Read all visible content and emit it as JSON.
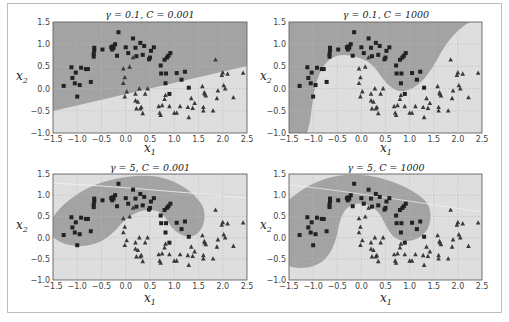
{
  "figure": {
    "colors": {
      "class0_region": "#a3a3a3",
      "class1_region": "#dedede",
      "square_marker": "#222222",
      "triangle_marker": "#3a3a3a",
      "grid": "#b9b9b9",
      "frame": "#bdbdbd",
      "axes_border": "#555555"
    }
  },
  "chart_data": [
    {
      "type": "scatter",
      "panel": "top-left",
      "title": "γ = 0.1, C = 0.001",
      "gamma": 0.1,
      "C": 0.001,
      "xlabel": "x1",
      "ylabel": "x2",
      "xlim": [
        -1.5,
        2.5
      ],
      "ylim": [
        -1.0,
        1.5
      ],
      "xticks": [
        -1.5,
        -1.0,
        -0.5,
        0.0,
        0.5,
        1.0,
        1.5,
        2.0,
        2.5
      ],
      "yticks": [
        -1.0,
        -0.5,
        0.0,
        0.5,
        1.0,
        1.5
      ],
      "xtick_labels": [
        "−1.5",
        "−1.0",
        "−0.5",
        "0.0",
        "0.5",
        "1.0",
        "1.5",
        "2.0",
        "2.5"
      ],
      "ytick_labels": [
        "−1.0",
        "−0.5",
        "0.0",
        "0.5",
        "1.0",
        "1.5"
      ],
      "grid": true,
      "decision_boundary": "nearly linear, rising from (-1.5,-0.6) to (2.5,1.0)"
    },
    {
      "type": "scatter",
      "panel": "top-right",
      "title": "γ = 0.1, C = 1000",
      "gamma": 0.1,
      "C": 1000,
      "xlabel": "x1",
      "ylabel": "x2",
      "xlim": [
        -1.5,
        2.5
      ],
      "ylim": [
        -1.0,
        1.5
      ],
      "xticks": [
        -1.5,
        -1.0,
        -0.5,
        0.0,
        0.5,
        1.0,
        1.5,
        2.0,
        2.5
      ],
      "yticks": [
        -1.0,
        -0.5,
        0.0,
        0.5,
        1.0,
        1.5
      ],
      "xtick_labels": [
        "−1.5",
        "−1.0",
        "−0.5",
        "0.0",
        "0.5",
        "1.0",
        "1.5",
        "2.0",
        "2.5"
      ],
      "ytick_labels": [
        "−1.0",
        "−0.5",
        "0.0",
        "0.5",
        "1.0",
        "1.5"
      ],
      "grid": true,
      "decision_boundary": "smooth S-shaped curve following the moons"
    },
    {
      "type": "scatter",
      "panel": "bottom-left",
      "title": "γ = 5, C = 0.001",
      "gamma": 5,
      "C": 0.001,
      "xlabel": "x1",
      "ylabel": "x2",
      "xlim": [
        -1.5,
        2.5
      ],
      "ylim": [
        -1.0,
        1.5
      ],
      "xticks": [
        -1.5,
        -1.0,
        -0.5,
        0.0,
        0.5,
        1.0,
        1.5,
        2.0,
        2.5
      ],
      "yticks": [
        -1.0,
        -0.5,
        0.0,
        0.5,
        1.0,
        1.5
      ],
      "xtick_labels": [
        "−1.5",
        "−1.0",
        "−0.5",
        "0.0",
        "0.5",
        "1.0",
        "1.5",
        "2.0",
        "2.5"
      ],
      "ytick_labels": [
        "−1.0",
        "−0.5",
        "0.0",
        "0.5",
        "1.0",
        "1.5"
      ],
      "grid": true,
      "decision_boundary": "band-shaped region enclosing the upper moon"
    },
    {
      "type": "scatter",
      "panel": "bottom-right",
      "title": "γ = 5, C = 1000",
      "gamma": 5,
      "C": 1000,
      "xlabel": "x1",
      "ylabel": "x2",
      "xlim": [
        -1.5,
        2.5
      ],
      "ylim": [
        -1.0,
        1.5
      ],
      "xticks": [
        -1.5,
        -1.0,
        -0.5,
        0.0,
        0.5,
        1.0,
        1.5,
        2.0,
        2.5
      ],
      "yticks": [
        -1.0,
        -0.5,
        0.0,
        0.5,
        1.0,
        1.5
      ],
      "xtick_labels": [
        "−1.5",
        "−1.0",
        "−0.5",
        "0.0",
        "0.5",
        "1.0",
        "1.5",
        "2.0",
        "2.5"
      ],
      "ytick_labels": [
        "−1.0",
        "−0.5",
        "0.0",
        "0.5",
        "1.0",
        "1.5"
      ],
      "grid": true,
      "decision_boundary": "irregular, tightly fitted region around the upper moon"
    }
  ],
  "dataset": {
    "class0_squares": [
      [
        -1.28,
        0.06
      ],
      [
        -1.12,
        0.48
      ],
      [
        -1.1,
        0.24
      ],
      [
        -1.05,
        0.12
      ],
      [
        -1.03,
        0.36
      ],
      [
        -1.0,
        -0.18
      ],
      [
        -0.95,
        0.08
      ],
      [
        -0.92,
        0.47
      ],
      [
        -0.82,
        0.44
      ],
      [
        -0.78,
        0.44
      ],
      [
        -0.72,
        0.15
      ],
      [
        -0.66,
        0.72
      ],
      [
        -0.66,
        0.78
      ],
      [
        -0.65,
        0.86
      ],
      [
        -0.65,
        0.92
      ],
      [
        -0.48,
        0.88
      ],
      [
        -0.3,
        0.93
      ],
      [
        -0.28,
        0.88
      ],
      [
        -0.27,
        0.95
      ],
      [
        -0.25,
        0.92
      ],
      [
        -0.22,
        1.0
      ],
      [
        -0.18,
        0.74
      ],
      [
        -0.15,
        1.27
      ],
      [
        0.0,
        0.93
      ],
      [
        0.05,
        0.8
      ],
      [
        0.15,
        1.13
      ],
      [
        0.2,
        0.92
      ],
      [
        0.22,
        0.73
      ],
      [
        0.3,
        1.03
      ],
      [
        0.35,
        0.76
      ],
      [
        0.38,
        0.96
      ],
      [
        0.48,
        0.66
      ],
      [
        0.5,
        0.7
      ],
      [
        0.52,
        0.85
      ],
      [
        0.58,
        0.93
      ],
      [
        0.72,
        0.52
      ],
      [
        0.73,
        0.34
      ],
      [
        0.8,
        0.65
      ],
      [
        0.82,
        0.12
      ],
      [
        0.83,
        0.34
      ],
      [
        0.85,
        0.7
      ],
      [
        0.88,
        0.74
      ],
      [
        0.9,
        -0.12
      ],
      [
        0.92,
        0.8
      ],
      [
        1.05,
        0.35
      ],
      [
        1.15,
        0.2
      ],
      [
        1.22,
        0.38
      ],
      [
        1.3,
        0.02
      ]
    ],
    "class1_triangles": [
      [
        -0.05,
        0.45
      ],
      [
        -0.05,
        0.12
      ],
      [
        -0.02,
        0.25
      ],
      [
        -0.02,
        -0.18
      ],
      [
        0.02,
        -0.07
      ],
      [
        0.08,
        0.49
      ],
      [
        0.15,
        0.7
      ],
      [
        0.2,
        -0.12
      ],
      [
        0.2,
        -0.27
      ],
      [
        0.22,
        -0.45
      ],
      [
        0.25,
        -0.3
      ],
      [
        0.28,
        0.0
      ],
      [
        0.3,
        -0.45
      ],
      [
        0.32,
        -0.42
      ],
      [
        0.35,
        -0.56
      ],
      [
        0.4,
        -0.12
      ],
      [
        0.45,
        0.0
      ],
      [
        0.68,
        -0.4
      ],
      [
        0.7,
        -0.55
      ],
      [
        0.72,
        -0.6
      ],
      [
        0.75,
        -0.38
      ],
      [
        0.8,
        -0.24
      ],
      [
        0.82,
        -0.15
      ],
      [
        0.9,
        -0.4
      ],
      [
        1.0,
        -0.55
      ],
      [
        1.05,
        -0.55
      ],
      [
        1.12,
        -0.4
      ],
      [
        1.28,
        -0.42
      ],
      [
        1.3,
        -0.65
      ],
      [
        1.35,
        -0.22
      ],
      [
        1.38,
        -0.44
      ],
      [
        1.42,
        -0.33
      ],
      [
        1.58,
        0.05
      ],
      [
        1.6,
        -0.42
      ],
      [
        1.6,
        -0.5
      ],
      [
        1.62,
        -0.09
      ],
      [
        1.63,
        -0.12
      ],
      [
        1.65,
        -0.16
      ],
      [
        1.8,
        -0.5
      ],
      [
        1.85,
        0.65
      ],
      [
        1.88,
        -0.22
      ],
      [
        1.9,
        -0.05
      ],
      [
        1.98,
        0.3
      ],
      [
        2.0,
        0.36
      ],
      [
        2.02,
        0.07
      ],
      [
        2.05,
        0.0
      ],
      [
        2.1,
        0.33
      ],
      [
        2.22,
        -0.2
      ],
      [
        2.42,
        0.35
      ]
    ]
  }
}
